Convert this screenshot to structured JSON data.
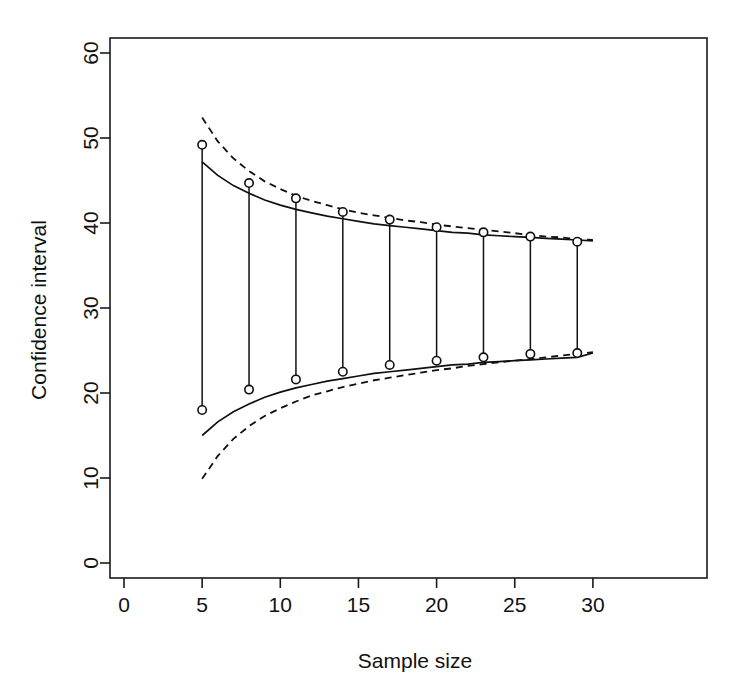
{
  "figure": {
    "background_color": "#ffffff",
    "ink_color": "#101010"
  },
  "chart_data": {
    "type": "line",
    "title": "",
    "xlabel": "Sample size",
    "ylabel": "Confidence interval",
    "xlim": [
      0,
      30
    ],
    "ylim": [
      0,
      60
    ],
    "xticks": [
      0,
      5,
      10,
      15,
      20,
      25,
      30
    ],
    "yticks": [
      0,
      10,
      20,
      30,
      40,
      50,
      60
    ],
    "xtick_labels": [
      "0",
      "5",
      "10",
      "15",
      "20",
      "25",
      "30"
    ],
    "ytick_labels": [
      "0",
      "10",
      "20",
      "30",
      "40",
      "50",
      "60"
    ],
    "grid": false,
    "legend": "none",
    "box": true,
    "x": [
      5,
      8,
      11,
      14,
      17,
      20,
      23,
      26,
      29
    ],
    "series": [
      {
        "name": "observed upper limit",
        "style": "points",
        "marker": "open-circle",
        "values": [
          49.2,
          44.7,
          42.9,
          41.3,
          40.4,
          39.5,
          38.9,
          38.4,
          37.8
        ]
      },
      {
        "name": "observed lower limit",
        "style": "points",
        "marker": "open-circle",
        "values": [
          18.0,
          20.4,
          21.6,
          22.5,
          23.3,
          23.8,
          24.2,
          24.6,
          24.7
        ]
      },
      {
        "name": "theoretical upper limit",
        "style": "solid",
        "x": [
          5,
          6,
          7,
          8,
          9,
          10,
          11,
          12,
          13,
          14,
          15,
          16,
          17,
          18,
          19,
          20,
          21,
          22,
          23,
          24,
          25,
          26,
          27,
          28,
          29,
          30
        ],
        "values": [
          47.2,
          45.6,
          44.4,
          43.5,
          42.7,
          42.1,
          41.6,
          41.2,
          40.8,
          40.5,
          40.2,
          39.9,
          39.7,
          39.5,
          39.3,
          39.1,
          38.9,
          38.8,
          38.6,
          38.5,
          38.4,
          38.3,
          38.2,
          38.1,
          38.0,
          37.9
        ]
      },
      {
        "name": "theoretical lower limit",
        "style": "solid",
        "x": [
          5,
          6,
          7,
          8,
          9,
          10,
          11,
          12,
          13,
          14,
          15,
          16,
          17,
          18,
          19,
          20,
          21,
          22,
          23,
          24,
          25,
          26,
          27,
          28,
          29,
          30
        ],
        "values": [
          15.0,
          16.6,
          17.8,
          18.7,
          19.5,
          20.1,
          20.6,
          21.0,
          21.4,
          21.7,
          22.0,
          22.3,
          22.5,
          22.7,
          22.9,
          23.1,
          23.3,
          23.4,
          23.6,
          23.7,
          23.8,
          23.9,
          24.0,
          24.1,
          24.2,
          24.7
        ]
      },
      {
        "name": "approximate upper limit",
        "style": "dashed",
        "x": [
          5,
          6,
          7,
          8,
          9,
          10,
          11,
          12,
          13,
          14,
          15,
          16,
          17,
          18,
          19,
          20,
          21,
          22,
          23,
          24,
          25,
          26,
          27,
          28,
          29,
          30
        ],
        "values": [
          52.4,
          49.6,
          47.6,
          46.1,
          44.9,
          44.0,
          43.2,
          42.6,
          42.1,
          41.6,
          41.2,
          40.9,
          40.6,
          40.3,
          40.1,
          39.8,
          39.6,
          39.4,
          39.2,
          39.0,
          38.8,
          38.6,
          38.4,
          38.3,
          38.1,
          38.0
        ]
      },
      {
        "name": "approximate lower limit",
        "style": "dashed",
        "x": [
          5,
          6,
          7,
          8,
          9,
          10,
          11,
          12,
          13,
          14,
          15,
          16,
          17,
          18,
          19,
          20,
          21,
          22,
          23,
          24,
          25,
          26,
          27,
          28,
          29,
          30
        ],
        "values": [
          9.9,
          12.6,
          14.6,
          16.1,
          17.3,
          18.2,
          19.0,
          19.7,
          20.2,
          20.7,
          21.1,
          21.5,
          21.8,
          22.1,
          22.4,
          22.7,
          22.9,
          23.2,
          23.4,
          23.6,
          23.8,
          24.0,
          24.2,
          24.4,
          24.6,
          24.8
        ]
      }
    ],
    "whiskers": {
      "name": "vertical connector segments",
      "x": [
        5,
        8,
        11,
        14,
        17,
        20,
        23,
        26,
        29
      ],
      "top": [
        49.2,
        44.7,
        42.9,
        41.3,
        40.4,
        39.5,
        38.9,
        38.4,
        37.8
      ],
      "bottom": [
        18.0,
        20.4,
        21.6,
        22.5,
        23.3,
        23.8,
        24.2,
        24.6,
        24.7
      ]
    }
  }
}
